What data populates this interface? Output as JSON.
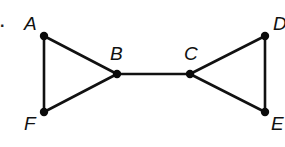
{
  "diagram": {
    "type": "graph",
    "problem_marker": ".",
    "nodes": [
      {
        "id": "A",
        "label": "A",
        "x": 44,
        "y": 36,
        "label_x": 24,
        "label_y": 30
      },
      {
        "id": "B",
        "label": "B",
        "x": 117,
        "y": 74,
        "label_x": 110,
        "label_y": 60
      },
      {
        "id": "C",
        "label": "C",
        "x": 190,
        "y": 74,
        "label_x": 184,
        "label_y": 60
      },
      {
        "id": "D",
        "label": "D",
        "x": 265,
        "y": 36,
        "label_x": 273,
        "label_y": 30
      },
      {
        "id": "E",
        "label": "E",
        "x": 265,
        "y": 112,
        "label_x": 271,
        "label_y": 130
      },
      {
        "id": "F",
        "label": "F",
        "x": 44,
        "y": 112,
        "label_x": 24,
        "label_y": 130
      }
    ],
    "edges": [
      {
        "from": "A",
        "to": "B"
      },
      {
        "from": "A",
        "to": "F"
      },
      {
        "from": "F",
        "to": "B"
      },
      {
        "from": "B",
        "to": "C"
      },
      {
        "from": "C",
        "to": "D"
      },
      {
        "from": "C",
        "to": "E"
      },
      {
        "from": "D",
        "to": "E"
      }
    ],
    "colors": {
      "stroke": "#111111",
      "node": "#0a0a0a",
      "background": "#ffffff"
    }
  }
}
